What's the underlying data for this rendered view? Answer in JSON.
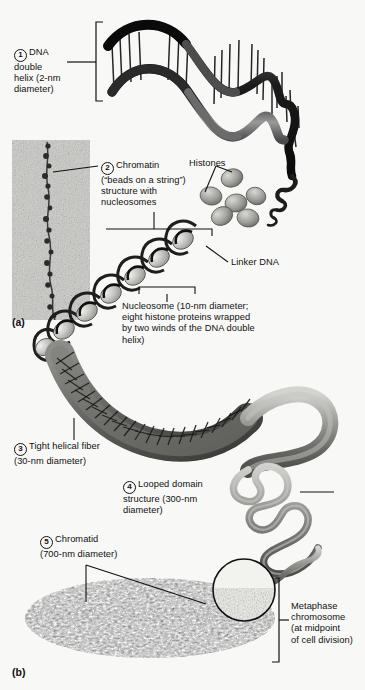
{
  "figure": {
    "background": "#f8f8f6",
    "ink": "#111111",
    "panels": [
      {
        "id": "a",
        "label": "(a)"
      },
      {
        "id": "b",
        "label": "(b)"
      }
    ]
  },
  "labels": {
    "step1": {
      "number": "1",
      "text": "DNA\ndouble\nhelix (2-nm\ndiameter)"
    },
    "step2": {
      "number": "2",
      "text": "Chromatin\n(“beads on a string”)\nstructure with\nnucleosomes"
    },
    "step3": {
      "number": "3",
      "text": "Tight helical fiber\n(30-nm diameter)"
    },
    "step4": {
      "number": "4",
      "text": "Looped domain\nstructure (300-nm\ndiameter)"
    },
    "step5": {
      "number": "5",
      "text": "Chromatid\n(700-nm diameter)"
    },
    "histones": {
      "text": "Histones"
    },
    "linker_dna": {
      "text": "Linker DNA"
    },
    "nucleosome": {
      "text": "Nucleosome (10-nm diameter;\neight histone proteins wrapped\nby two winds of the DNA double\nhelix)"
    },
    "metaphase": {
      "text": "Metaphase\nchromosome\n(at midpoint\nof cell division)"
    }
  },
  "graphics": {
    "dna_helix": {
      "name": "dna-double-helix",
      "ribbon_dark": "#171717",
      "ribbon_light": "#8d8d8d",
      "rungs": 26
    },
    "micrograph": {
      "name": "chromatin-micrograph",
      "beads": 17,
      "tone": "#9a9a96"
    },
    "histone_beads": {
      "name": "histone-proteins",
      "count": 6,
      "fill": "#b8b8b4"
    },
    "nucleosome_coil": {
      "name": "nucleosome-beads-on-string",
      "beads": 6
    },
    "helical_fiber": {
      "name": "tight-helical-fiber-30nm",
      "fill": "#6e6e6a"
    },
    "looped_domain": {
      "name": "looped-domain-300nm",
      "fill": "#8a8a86"
    },
    "chromatid": {
      "name": "metaphase-chromatid-700nm",
      "fill": "#3a3a38"
    },
    "inset_circle": {
      "name": "chromatid-inset-magnifier"
    }
  }
}
